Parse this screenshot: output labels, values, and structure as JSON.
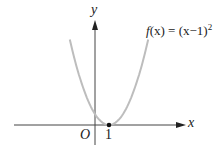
{
  "chart_data": {
    "type": "line",
    "title": "",
    "function_label": "f(x) = (x−1)²",
    "function_label_parts": {
      "name": "f",
      "arg": "(x)",
      "eq": " = (x−1)",
      "exp": "2"
    },
    "xlabel": "x",
    "ylabel": "y",
    "origin_label": "O",
    "tick_labels": {
      "x": [
        "1"
      ]
    },
    "marked_points": [
      {
        "x": 1,
        "y": 0,
        "label": "1"
      }
    ],
    "series": [
      {
        "name": "f(x) = (x−1)²",
        "x": [
          -1.8,
          -1,
          0,
          1,
          2,
          3,
          3.8
        ],
        "values": [
          7.84,
          4,
          1,
          0,
          1,
          4,
          7.84
        ]
      }
    ],
    "curve_color": "#bdbdbd",
    "axis_color": "#444444",
    "grid": false,
    "legend": "none"
  }
}
